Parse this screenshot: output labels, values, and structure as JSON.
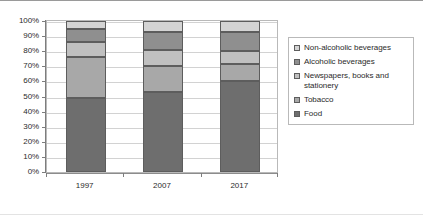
{
  "chart_data": {
    "type": "bar",
    "subtype": "100% stacked column",
    "title": "",
    "subtitle": "",
    "xlabel": "",
    "ylabel": "",
    "categories": [
      "1997",
      "2007",
      "2017"
    ],
    "ylim": [
      0,
      100
    ],
    "y_tick_labels": [
      "0%",
      "10%",
      "20%",
      "30%",
      "40%",
      "50%",
      "60%",
      "70%",
      "80%",
      "90%",
      "100%"
    ],
    "y_tick_values": [
      0,
      10,
      20,
      30,
      40,
      50,
      60,
      70,
      80,
      90,
      100
    ],
    "grid": true,
    "grid_axis": "y",
    "legend_position": "right",
    "stack_order_bottom_to_top": [
      "Food",
      "Tobacco",
      "Newspapers, books and stationery",
      "Alcoholic beverages",
      "Non-alcoholic beverages"
    ],
    "series": [
      {
        "name": "Non-alcoholic beverages",
        "color": "#d4d4d4",
        "values": [
          5.0,
          7.0,
          7.5
        ],
        "cumulative_top": [
          100.0,
          100.0,
          100.0
        ],
        "cumulative_bottom": [
          95.0,
          93.0,
          92.5
        ]
      },
      {
        "name": "Alcoholic beverages",
        "color": "#8f8f8f",
        "values": [
          9.0,
          12.5,
          12.5
        ],
        "cumulative_top": [
          95.0,
          93.0,
          92.5
        ],
        "cumulative_bottom": [
          86.0,
          80.5,
          80.0
        ]
      },
      {
        "name": "Newspapers, books and stationery",
        "color": "#c0c0c0",
        "values": [
          10.0,
          10.5,
          8.5
        ],
        "cumulative_top": [
          86.0,
          80.5,
          80.0
        ],
        "cumulative_bottom": [
          76.0,
          70.0,
          71.5
        ]
      },
      {
        "name": "Tobacco",
        "color": "#a8a8a8",
        "values": [
          27.0,
          17.0,
          11.5
        ],
        "cumulative_top": [
          76.0,
          70.0,
          71.5
        ],
        "cumulative_bottom": [
          49.0,
          53.0,
          60.0
        ]
      },
      {
        "name": "Food",
        "color": "#6e6e6e",
        "values": [
          49.0,
          53.0,
          60.0
        ],
        "cumulative_top": [
          49.0,
          53.0,
          60.0
        ],
        "cumulative_bottom": [
          0.0,
          0.0,
          0.0
        ]
      }
    ]
  },
  "legend": {
    "items": [
      {
        "label": "Non-alcoholic beverages",
        "color": "#d4d4d4"
      },
      {
        "label": "Alcoholic beverages",
        "color": "#8f8f8f"
      },
      {
        "label": "Newspapers, books and stationery",
        "color": "#c0c0c0"
      },
      {
        "label": "Tobacco",
        "color": "#a8a8a8"
      },
      {
        "label": "Food",
        "color": "#6e6e6e"
      }
    ]
  },
  "colors": {
    "plot_border": "#b9b9b9",
    "gridline": "#d2d2d2",
    "axis_line": "#8c8c8c",
    "bar_outline": "#5d5d5d",
    "text": "#2b2b2b",
    "background": "#ffffff"
  }
}
